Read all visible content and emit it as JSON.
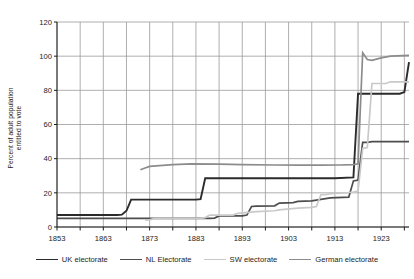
{
  "chart_data": {
    "type": "line",
    "title": "",
    "xlabel": "",
    "ylabel": "Percent of adult population entitled to vote",
    "ylabel_line1": "Percent of adult population",
    "ylabel_line2": "entitled to vote",
    "xlim": [
      1853,
      1929
    ],
    "ylim": [
      0,
      120
    ],
    "ytick_values": [
      0,
      20,
      40,
      60,
      80,
      100,
      120
    ],
    "yticks": [
      "0",
      "20",
      "40",
      "60",
      "80",
      "100",
      "120"
    ],
    "xtick_values": [
      1853,
      1863,
      1873,
      1883,
      1893,
      1903,
      1913,
      1923
    ],
    "xticks": [
      "1853",
      "1863",
      "1873",
      "1883",
      "1893",
      "1903",
      "1913",
      "1923"
    ],
    "xminor_step": 5,
    "grid": true,
    "grid_color": "#9a9a9a",
    "legend_position": "bottom",
    "series": [
      {
        "name": "UK electorate",
        "color": "#2b2b2b",
        "width": 1.9,
        "points": [
          [
            1853,
            7.0
          ],
          [
            1866,
            7.0
          ],
          [
            1867,
            7.2
          ],
          [
            1868,
            9.5
          ],
          [
            1869,
            16.0
          ],
          [
            1883,
            16.0
          ],
          [
            1884,
            16.3
          ],
          [
            1885,
            28.5
          ],
          [
            1913,
            28.5
          ],
          [
            1917,
            29.0
          ],
          [
            1918,
            78.0
          ],
          [
            1919,
            78.0
          ],
          [
            1927,
            78.0
          ],
          [
            1928,
            79.0
          ],
          [
            1929,
            96.5
          ]
        ]
      },
      {
        "name": "NL Electorate",
        "color": "#4d4d4d",
        "width": 1.7,
        "points": [
          [
            1853,
            5.0
          ],
          [
            1886,
            5.0
          ],
          [
            1887,
            5.2
          ],
          [
            1888,
            6.5
          ],
          [
            1893,
            6.5
          ],
          [
            1894,
            7.0
          ],
          [
            1895,
            12.0
          ],
          [
            1896,
            12.2
          ],
          [
            1900,
            12.4
          ],
          [
            1901,
            14.0
          ],
          [
            1904,
            14.3
          ],
          [
            1905,
            15.0
          ],
          [
            1908,
            15.3
          ],
          [
            1912,
            17.0
          ],
          [
            1916,
            17.5
          ],
          [
            1917,
            27.0
          ],
          [
            1918,
            27.5
          ],
          [
            1919,
            49.5
          ],
          [
            1920,
            49.5
          ],
          [
            1921,
            50.0
          ],
          [
            1929,
            50.0
          ]
        ]
      },
      {
        "name": "SW electorate",
        "color": "#c9c9c9",
        "width": 1.7,
        "points": [
          [
            1872,
            4.0
          ],
          [
            1873,
            4.2
          ],
          [
            1874,
            5.0
          ],
          [
            1884,
            5.0
          ],
          [
            1885,
            5.5
          ],
          [
            1886,
            7.0
          ],
          [
            1891,
            7.0
          ],
          [
            1892,
            8.0
          ],
          [
            1896,
            9.0
          ],
          [
            1900,
            9.5
          ],
          [
            1901,
            10.0
          ],
          [
            1905,
            11.0
          ],
          [
            1908,
            11.5
          ],
          [
            1909,
            12.0
          ],
          [
            1910,
            19.0
          ],
          [
            1911,
            19.0
          ],
          [
            1912,
            19.5
          ],
          [
            1915,
            20.0
          ],
          [
            1916,
            20.2
          ],
          [
            1917,
            20.5
          ],
          [
            1918,
            21.0
          ],
          [
            1919,
            46.0
          ],
          [
            1920,
            46.5
          ],
          [
            1921,
            84.0
          ],
          [
            1924,
            84.0
          ],
          [
            1925,
            85.0
          ],
          [
            1929,
            85.0
          ]
        ]
      },
      {
        "name": "German electorate",
        "color": "#8c8c8c",
        "width": 1.7,
        "points": [
          [
            1871,
            33.5
          ],
          [
            1872,
            34.5
          ],
          [
            1873,
            35.5
          ],
          [
            1878,
            36.5
          ],
          [
            1882,
            37.0
          ],
          [
            1888,
            36.8
          ],
          [
            1893,
            36.5
          ],
          [
            1900,
            36.3
          ],
          [
            1905,
            36.2
          ],
          [
            1910,
            36.2
          ],
          [
            1914,
            36.3
          ],
          [
            1917,
            36.5
          ],
          [
            1918,
            37.0
          ],
          [
            1919,
            102.0
          ],
          [
            1920,
            98.0
          ],
          [
            1921,
            97.5
          ],
          [
            1923,
            99.0
          ],
          [
            1925,
            100.0
          ],
          [
            1929,
            100.5
          ]
        ]
      }
    ],
    "legend": [
      {
        "label": "UK electorate",
        "color": "#2b2b2b"
      },
      {
        "label": "NL Electorate",
        "color": "#4d4d4d"
      },
      {
        "label": "SW electorate",
        "color": "#c9c9c9"
      },
      {
        "label": "German electorate",
        "color": "#8c8c8c"
      }
    ]
  }
}
